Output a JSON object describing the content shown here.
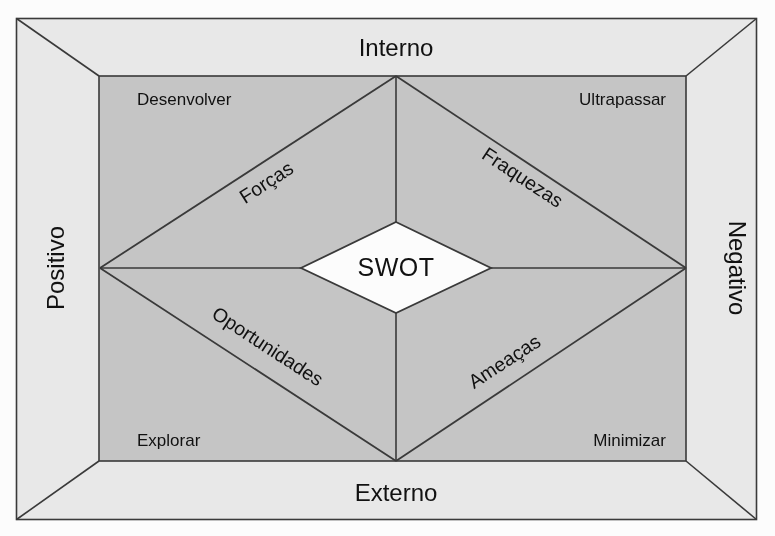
{
  "diagram": {
    "title": "SWOT",
    "center": {
      "label": "SWOT"
    },
    "axes": {
      "top": "Interno",
      "bottom": "Externo",
      "left": "Positivo",
      "right": "Negativo"
    },
    "quadrant_labels": {
      "top_left": "Desenvolver",
      "top_right": "Ultrapassar",
      "bottom_left": "Explorar",
      "bottom_right": "Minimizar"
    },
    "edge_labels": {
      "top_left": "Forças",
      "top_right": "Fraquezas",
      "bottom_left": "Oportunidades",
      "bottom_right": "Ameaças"
    },
    "colors": {
      "page_background": "#ffffff",
      "frame_fill": "#ebebeb",
      "panel_fill": "#c8c8c8",
      "center_fill": "#ffffff",
      "line": "#3a3a3a",
      "text": "#111111"
    }
  }
}
